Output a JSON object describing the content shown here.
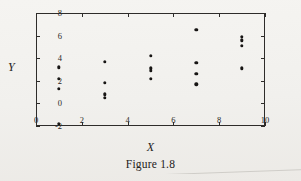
{
  "figure": {
    "caption": "Figure 1.8",
    "axis_title_x": "X",
    "axis_title_y": "Y",
    "ink_color": "#171514",
    "paper_color": "#f2f1ee"
  },
  "chart_data": {
    "type": "scatter",
    "title": "Figure 1.8",
    "xlabel": "X",
    "ylabel": "Y",
    "xlim": [
      0,
      10
    ],
    "ylim": [
      -2,
      8
    ],
    "xticks": [
      0,
      2,
      4,
      6,
      8,
      10
    ],
    "yticks": [
      -2,
      0,
      2,
      4,
      6,
      8
    ],
    "xtick_labels": [
      "0",
      "2",
      "4",
      "6",
      "8",
      "10"
    ],
    "ytick_labels": [
      "-2",
      "0",
      "2",
      "4",
      "6",
      "8"
    ],
    "grid": false,
    "legend": null,
    "marker": "filled-circle",
    "points": [
      {
        "x": 1,
        "y": 3.2
      },
      {
        "x": 1,
        "y": 2.2
      },
      {
        "x": 1,
        "y": 1.3
      },
      {
        "x": 1,
        "y": -1.8
      },
      {
        "x": 3,
        "y": 3.7
      },
      {
        "x": 3,
        "y": 1.8
      },
      {
        "x": 3,
        "y": 0.8
      },
      {
        "x": 3,
        "y": 0.5
      },
      {
        "x": 5,
        "y": 4.2
      },
      {
        "x": 5,
        "y": 3.1
      },
      {
        "x": 5,
        "y": 2.9
      },
      {
        "x": 5,
        "y": 2.2
      },
      {
        "x": 7,
        "y": 6.5
      },
      {
        "x": 7,
        "y": 3.6
      },
      {
        "x": 7,
        "y": 2.6
      },
      {
        "x": 7,
        "y": 1.7
      },
      {
        "x": 9,
        "y": 5.9
      },
      {
        "x": 9,
        "y": 5.6
      },
      {
        "x": 9,
        "y": 5.1
      },
      {
        "x": 9,
        "y": 3.1
      }
    ]
  }
}
